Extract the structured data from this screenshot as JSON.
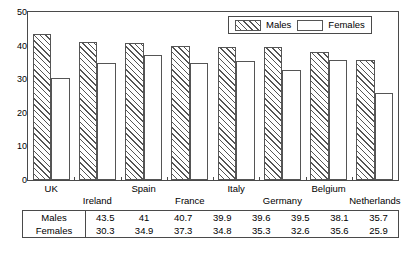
{
  "chart_data": {
    "type": "bar",
    "title": "",
    "xlabel": "",
    "ylabel": "",
    "ylim": [
      0,
      50
    ],
    "yticks": [
      0,
      10,
      20,
      30,
      40,
      50
    ],
    "grid": false,
    "legend_position": "top-right",
    "categories": [
      "UK",
      "Ireland",
      "Spain",
      "France",
      "Italy",
      "Germany",
      "Belgium",
      "Netherlands"
    ],
    "series": [
      {
        "name": "Males",
        "values": [
          43.5,
          41,
          40.7,
          39.9,
          39.6,
          39.5,
          38.1,
          35.7
        ]
      },
      {
        "name": "Females",
        "values": [
          30.3,
          34.9,
          37.3,
          34.8,
          35.3,
          32.6,
          35.6,
          25.9
        ]
      }
    ]
  },
  "legend": {
    "entries": [
      {
        "label": "Males"
      },
      {
        "label": "Females"
      }
    ]
  },
  "table": {
    "rows": [
      {
        "label": "Males",
        "cells": [
          "43.5",
          "41",
          "40.7",
          "39.9",
          "39.6",
          "39.5",
          "38.1",
          "35.7"
        ]
      },
      {
        "label": "Females",
        "cells": [
          "30.3",
          "34.9",
          "37.3",
          "34.8",
          "35.3",
          "32.6",
          "35.6",
          "25.9"
        ]
      }
    ]
  },
  "axis": {
    "ytick_labels": [
      "50",
      "40",
      "30",
      "20",
      "10",
      "0"
    ]
  },
  "colors": {
    "line": "#4a4a4a",
    "bar_edge": "#555555",
    "background": "#ffffff"
  }
}
